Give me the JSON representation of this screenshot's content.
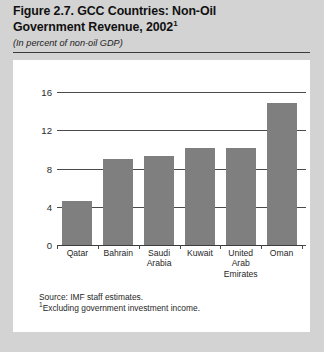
{
  "header": {
    "title_line1": "Figure 2.7. GCC Countries: Non-Oil",
    "title_line2": "Government Revenue, 2002",
    "title_superscript": "1",
    "subtitle": "(In percent of non-oil GDP)"
  },
  "footnotes": {
    "source": "Source: IMF staff estimates.",
    "note_marker": "1",
    "note": "Excluding government investment income."
  },
  "chart_data": {
    "type": "bar",
    "title": "Figure 2.7. GCC Countries: Non-Oil Government Revenue, 2002",
    "subtitle": "(In percent of non-oil GDP)",
    "xlabel": "",
    "ylabel": "",
    "ylim": [
      0,
      16
    ],
    "yticks": [
      0,
      4,
      8,
      12,
      16
    ],
    "ytick_labels": [
      "0",
      "4",
      "8",
      "12",
      "16"
    ],
    "grid": true,
    "legend": false,
    "bar_color": "#807f80",
    "categories": [
      "Qatar",
      "Bahrain",
      "Saudi Arabia",
      "Kuwait",
      "United Arab Emirates",
      "Oman"
    ],
    "category_label_lines": [
      [
        "Qatar"
      ],
      [
        "Bahrain"
      ],
      [
        "Saudi",
        "Arabia"
      ],
      [
        "Kuwait"
      ],
      [
        "United",
        "Arab",
        "Emirates"
      ],
      [
        "Oman"
      ]
    ],
    "values": [
      4.6,
      9.0,
      9.3,
      10.1,
      10.1,
      14.8
    ]
  }
}
